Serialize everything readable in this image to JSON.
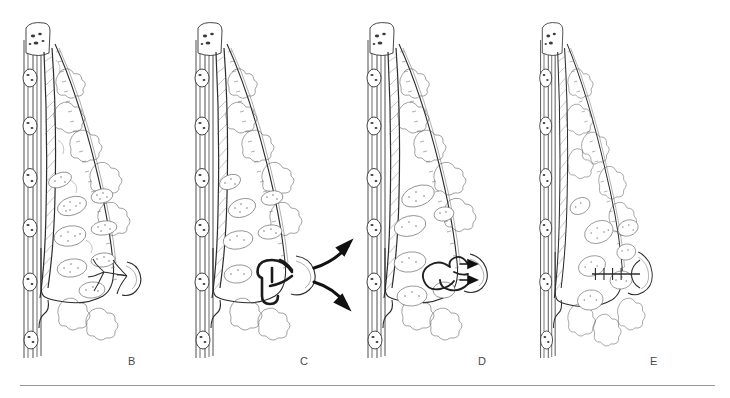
{
  "figure": {
    "type": "medical-illustration",
    "series_note": "Four-panel line-drawing series lettered B through E",
    "background_color": "#ffffff",
    "ink_color": "#2b2b2b",
    "baseline_color": "#9a9a9a"
  },
  "panels": [
    {
      "id": "b",
      "label": "B",
      "caption": "Normal breast: slender branching lactiferous ducts converging on the nipple",
      "duct_style": "normal",
      "nipple": "everted",
      "arrows": 0
    },
    {
      "id": "c",
      "label": "C",
      "caption": "Markedly dilated ducts with discharge exiting the nipple",
      "duct_style": "dilated-heavy",
      "nipple": "everted",
      "arrows": 2,
      "arrow_direction": "outward-right"
    },
    {
      "id": "d",
      "label": "D",
      "caption": "Tortuous ectatic ducts with secretions directed toward the nipple",
      "duct_style": "tortuous",
      "nipple": "everted",
      "arrows": 2,
      "arrow_direction": "right-toward-nipple"
    },
    {
      "id": "e",
      "label": "E",
      "caption": "Periductal fibrosis shortening the duct and retracting the nipple",
      "duct_style": "fibrosed-shortened",
      "nipple": "retracted",
      "arrows": 0,
      "fibrosis_ticks": 4
    }
  ],
  "anatomy": {
    "structures": [
      "rib cross-section",
      "pectoralis muscle",
      "skin and dermis",
      "subcutaneous fat lobules",
      "glandular lobules",
      "lactiferous duct",
      "nipple",
      "areola",
      "inframammary fold"
    ]
  }
}
